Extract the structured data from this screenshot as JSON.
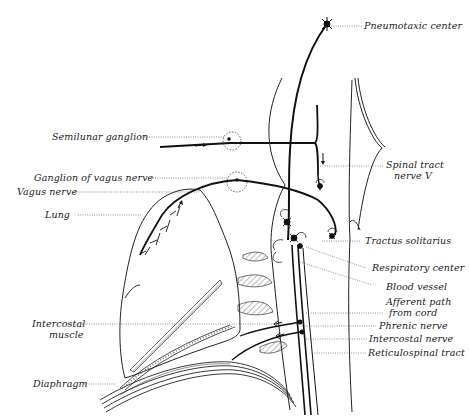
{
  "figure": {
    "title": "",
    "background": "#ffffff",
    "ink_color": "#111111",
    "labels": {
      "pneumotaxic_center": "Pneumotaxic center",
      "semilunar_ganglion": "Semilunar ganglion",
      "ganglion_of_vagus_nerve": "Ganglion of vagus nerve",
      "vagus_nerve": "Vagus nerve",
      "lung": "Lung",
      "intercostal_muscle_line1": "Intercostal",
      "intercostal_muscle_line2": "muscle",
      "diaphragm": "Diaphragm",
      "spinal_tract_nerve_v_line1": "Spinal tract",
      "spinal_tract_nerve_v_line2": "nerve V",
      "tractus_solitarius": "Tractus solitarius",
      "respiratory_center": "Respiratory center",
      "blood_vessel": "Blood vessel",
      "afferent_path_line1": "Afferent path",
      "afferent_path_line2": "from cord",
      "phrenic_nerve": "Phrenic nerve",
      "intercostal_nerve": "Intercostal nerve",
      "reticulospinal_tract": "Reticulospinal tract"
    }
  }
}
